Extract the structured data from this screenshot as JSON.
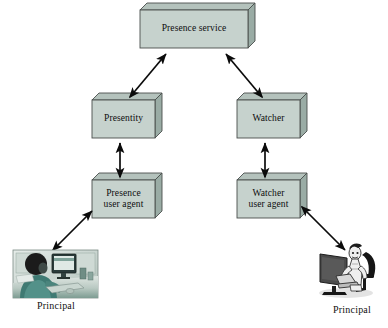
{
  "diagram": {
    "background_color": "#ffffff",
    "box_face_color": "#c6d2cd",
    "box_top_color": "#b4c2bc",
    "box_side_color": "#9fb0a9",
    "box_edge_color": "#4a4f4d",
    "arrow_color": "#0b0b0b",
    "nodes": [
      {
        "id": "presence-service",
        "label": "Presence service",
        "x": 140,
        "y": 10,
        "w": 108,
        "h": 38,
        "depth": 7
      },
      {
        "id": "presentity",
        "label": "Presentity",
        "x": 92,
        "y": 100,
        "w": 63,
        "h": 38,
        "depth": 7
      },
      {
        "id": "watcher",
        "label": "Watcher",
        "x": 237,
        "y": 100,
        "w": 63,
        "h": 38,
        "depth": 7
      },
      {
        "id": "presence-user-agent",
        "label": "Presence\nuser agent",
        "x": 92,
        "y": 180,
        "w": 63,
        "h": 38,
        "depth": 7
      },
      {
        "id": "watcher-user-agent",
        "label": "Watcher\nuser agent",
        "x": 237,
        "y": 180,
        "w": 63,
        "h": 38,
        "depth": 7
      }
    ],
    "edges": [
      {
        "id": "presentity-to-service",
        "from": "presentity",
        "to": "presence-service",
        "kind": "double-arrow",
        "x1": 130,
        "y1": 97,
        "x2": 166,
        "y2": 54
      },
      {
        "id": "watcher-to-service",
        "from": "watcher",
        "to": "presence-service",
        "kind": "double-arrow",
        "x1": 262,
        "y1": 97,
        "x2": 226,
        "y2": 54
      },
      {
        "id": "presentity-to-presence-user-agent",
        "from": "presence-user-agent",
        "to": "presentity",
        "kind": "double-arrow",
        "x1": 120,
        "y1": 177,
        "x2": 120,
        "y2": 143
      },
      {
        "id": "watcher-to-watcher-user-agent",
        "from": "watcher-user-agent",
        "to": "watcher",
        "kind": "double-arrow",
        "x1": 265,
        "y1": 177,
        "x2": 265,
        "y2": 143
      },
      {
        "id": "left-principal-to-presence-user-agent",
        "from": "left-principal",
        "to": "presence-user-agent",
        "kind": "double-arrow",
        "x1": 53,
        "y1": 250,
        "x2": 92,
        "y2": 211
      },
      {
        "id": "right-principal-to-watcher-user-agent",
        "from": "watcher-user-agent",
        "to": "right-principal",
        "kind": "double-arrow",
        "x1": 302,
        "y1": 207,
        "x2": 345,
        "y2": 250
      }
    ],
    "principals": [
      {
        "id": "left-principal",
        "label": "Principal",
        "label_x": 26,
        "label_y": 300,
        "image_x": 13,
        "image_y": 250,
        "image_w": 85,
        "image_h": 48,
        "style": "photo-desk-teal",
        "alt": "person seated at a desk using a desktop computer"
      },
      {
        "id": "right-principal",
        "label": "Principal",
        "label_x": 322,
        "label_y": 304,
        "image_x": 318,
        "image_y": 243,
        "image_w": 62,
        "image_h": 58,
        "style": "illustration-figure-gray",
        "alt": "stylized figure seated at a computer with monitor"
      }
    ]
  }
}
